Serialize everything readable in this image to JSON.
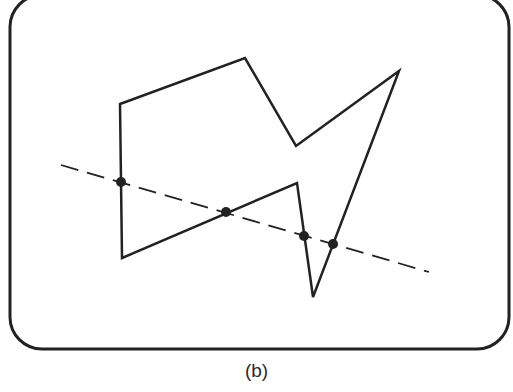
{
  "figure": {
    "caption": "(b)",
    "colors": {
      "ink": "#222222",
      "background": "#ffffff"
    },
    "frame": {
      "x": 10,
      "y": -5,
      "width": 499,
      "height": 354,
      "corner_radius": 32,
      "stroke_width": 3
    },
    "polygon": {
      "description": "Concave (non-convex) polygon",
      "vertices": [
        [
          120,
          104
        ],
        [
          245,
          58
        ],
        [
          296,
          146
        ],
        [
          399,
          71
        ],
        [
          313,
          297
        ],
        [
          297,
          183
        ],
        [
          122,
          258
        ]
      ],
      "stroke_width": 2.5
    },
    "scan_line": {
      "description": "Dashed line crossing the polygon",
      "start": [
        61,
        165
      ],
      "end": [
        429,
        272
      ],
      "dash": "18 9",
      "stroke_width": 1.8
    },
    "intersections": {
      "description": "Points where the dashed line crosses the polygon edges",
      "count": 4,
      "points": [
        [
          121,
          182
        ],
        [
          226,
          212
        ],
        [
          304,
          236
        ],
        [
          333,
          244
        ]
      ],
      "radius": 5
    }
  }
}
